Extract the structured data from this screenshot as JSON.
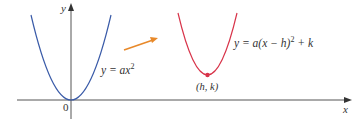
{
  "diagram": {
    "axes": {
      "x_label": "x",
      "y_label": "y",
      "origin_label": "0",
      "color": "#555555"
    },
    "curves": [
      {
        "name": "base-parabola",
        "equation": "y = ax²",
        "eq_prefix": "y = ax",
        "eq_sup": "2",
        "color": "#3a5ba8"
      },
      {
        "name": "shifted-parabola",
        "equation": "y = a(x − h)² + k",
        "eq_prefix": "y = a(x − h)",
        "eq_sup": "2",
        "eq_suffix": " + k",
        "color": "#d8344a"
      }
    ],
    "vertex_label": "(h, k)",
    "arrow_color": "#e8892a"
  }
}
